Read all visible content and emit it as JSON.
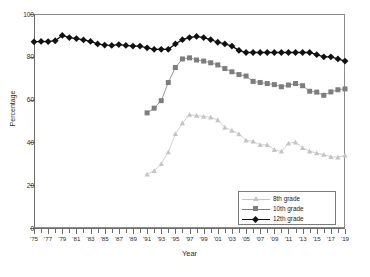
{
  "chart_data": {
    "type": "line",
    "title": "",
    "xlabel": "Year",
    "ylabel": "Percentage",
    "ylim": [
      0,
      100
    ],
    "yticks": [
      0,
      20,
      40,
      60,
      80,
      100
    ],
    "ytick_labels": [
      "0",
      "20",
      "40",
      "60",
      "80",
      "100"
    ],
    "xlim": [
      1975,
      2019
    ],
    "xtick_labels": [
      "'75",
      "'77",
      "'79",
      "'81",
      "'83",
      "'85",
      "'87",
      "'89",
      "'91",
      "'93",
      "'95",
      "'97",
      "'99",
      "'01",
      "'03",
      "'05",
      "'07",
      "'09",
      "'11",
      "'13",
      "'15",
      "'17",
      "'19"
    ],
    "xtick_years": [
      1975,
      1977,
      1979,
      1981,
      1983,
      1985,
      1987,
      1989,
      1991,
      1993,
      1995,
      1997,
      1999,
      2001,
      2003,
      2005,
      2007,
      2009,
      2011,
      2013,
      2015,
      2017,
      2019
    ],
    "grid": false,
    "legend_position": "lower right",
    "series": [
      {
        "name": "8th grade",
        "marker": "triangle",
        "color": "#c4c4c4",
        "x": [
          1991,
          1992,
          1993,
          1994,
          1995,
          1996,
          1997,
          1998,
          1999,
          2000,
          2001,
          2002,
          2003,
          2004,
          2005,
          2006,
          2007,
          2008,
          2009,
          2010,
          2011,
          2012,
          2013,
          2014,
          2015,
          2016,
          2017,
          2018,
          2019
        ],
        "values": [
          25.1,
          26.7,
          30.0,
          35.5,
          44.0,
          49.0,
          53.0,
          52.5,
          52.1,
          51.7,
          50.5,
          47.0,
          45.6,
          43.9,
          41.0,
          40.5,
          38.9,
          38.9,
          36.6,
          35.8,
          39.6,
          40.1,
          37.5,
          35.9,
          35.0,
          34.3,
          33.3,
          33.0,
          34.0
        ]
      },
      {
        "name": "10th grade",
        "marker": "square",
        "color": "#7d7d7d",
        "x": [
          1991,
          1992,
          1993,
          1994,
          1995,
          1996,
          1997,
          1998,
          1999,
          2000,
          2001,
          2002,
          2003,
          2004,
          2005,
          2006,
          2007,
          2008,
          2009,
          2010,
          2011,
          2012,
          2013,
          2014,
          2015,
          2016,
          2017,
          2018,
          2019
        ],
        "values": [
          53.8,
          56.0,
          59.5,
          68.0,
          75.0,
          79.0,
          79.5,
          78.5,
          78.0,
          77.2,
          76.2,
          74.5,
          73.0,
          71.7,
          71.0,
          68.5,
          68.0,
          67.5,
          67.0,
          66.0,
          66.8,
          67.5,
          66.5,
          63.9,
          63.5,
          62.0,
          63.6,
          64.6,
          65.0
        ]
      },
      {
        "name": "12th grade",
        "marker": "diamond",
        "color": "#111111",
        "x": [
          1975,
          1976,
          1977,
          1978,
          1979,
          1980,
          1981,
          1982,
          1983,
          1984,
          1985,
          1986,
          1987,
          1988,
          1989,
          1990,
          1991,
          1992,
          1993,
          1994,
          1995,
          1996,
          1997,
          1998,
          1999,
          2000,
          2001,
          2002,
          2003,
          2004,
          2005,
          2006,
          2007,
          2008,
          2009,
          2010,
          2011,
          2012,
          2013,
          2014,
          2015,
          2016,
          2017,
          2018,
          2019
        ],
        "values": [
          87.0,
          87.2,
          87.1,
          87.5,
          90.0,
          89.0,
          88.5,
          87.9,
          87.2,
          86.0,
          85.5,
          85.3,
          85.7,
          85.3,
          85.0,
          85.0,
          84.2,
          83.5,
          83.5,
          83.5,
          86.0,
          88.0,
          89.0,
          89.5,
          89.0,
          88.0,
          86.8,
          86.0,
          85.0,
          83.0,
          82.0,
          82.0,
          82.0,
          82.0,
          82.0,
          82.0,
          82.0,
          82.0,
          82.0,
          82.0,
          81.0,
          80.0,
          80.0,
          79.0,
          78.0
        ]
      }
    ]
  },
  "legend": {
    "entries": [
      {
        "label": "8th grade"
      },
      {
        "label": "10th grade"
      },
      {
        "label": "12th grade"
      }
    ]
  }
}
